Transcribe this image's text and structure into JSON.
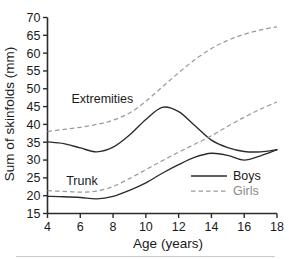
{
  "chart_data": {
    "type": "line",
    "title": "",
    "xlabel": "Age (years)",
    "ylabel": "Sum of skinfolds (mm)",
    "xlim": [
      4,
      18
    ],
    "ylim": [
      15,
      70
    ],
    "xticks": [
      4,
      6,
      8,
      10,
      12,
      14,
      16,
      18
    ],
    "yticks": [
      15,
      20,
      25,
      30,
      35,
      40,
      45,
      50,
      55,
      60,
      65,
      70
    ],
    "grid": false,
    "legend_position": "lower-right",
    "x": [
      4,
      5,
      6,
      7,
      8,
      9,
      10,
      11,
      12,
      13,
      14,
      15,
      16,
      17,
      18
    ],
    "series": [
      {
        "name": "Girls Extremities",
        "group": "Extremities",
        "sex": "Girls",
        "style": "dashed",
        "color": "#9a9a9a",
        "values": [
          38.0,
          38.6,
          39.2,
          40.0,
          41.2,
          43.2,
          46.5,
          50.5,
          54.5,
          58.2,
          61.3,
          63.6,
          65.3,
          66.5,
          67.4
        ]
      },
      {
        "name": "Boys Extremities",
        "group": "Extremities",
        "sex": "Boys",
        "style": "solid",
        "color": "#2b2b2b",
        "values": [
          35.1,
          34.6,
          33.4,
          32.3,
          33.6,
          37.0,
          41.4,
          44.8,
          43.6,
          39.6,
          35.6,
          33.5,
          32.4,
          32.3,
          32.9
        ]
      },
      {
        "name": "Girls Trunk",
        "group": "Trunk",
        "sex": "Girls",
        "style": "dashed",
        "color": "#9a9a9a",
        "values": [
          21.4,
          21.2,
          21.0,
          21.3,
          22.6,
          24.8,
          27.3,
          29.8,
          32.2,
          34.5,
          36.8,
          39.5,
          42.0,
          44.3,
          46.3
        ]
      },
      {
        "name": "Boys Trunk",
        "group": "Trunk",
        "sex": "Boys",
        "style": "solid",
        "color": "#2b2b2b",
        "values": [
          19.8,
          19.7,
          19.5,
          19.1,
          19.8,
          21.5,
          23.6,
          26.3,
          28.7,
          30.8,
          31.9,
          31.3,
          30.0,
          31.2,
          32.9
        ]
      }
    ],
    "annotations": [
      {
        "text": "Extremities",
        "x": 7.35,
        "y": 47.0
      },
      {
        "text": "Trunk",
        "x": 6.1,
        "y": 24.0
      }
    ],
    "legend": [
      {
        "label": "Boys",
        "style": "solid",
        "color": "#2b2b2b"
      },
      {
        "label": "Girls",
        "style": "dashed",
        "color": "#9a9a9a"
      }
    ]
  },
  "axes": {
    "y_title": "Sum of skinfolds (mm)",
    "x_title": "Age (years)",
    "y_tick_labels": [
      "70",
      "65",
      "60",
      "55",
      "50",
      "45",
      "40",
      "35",
      "30",
      "25",
      "20",
      "15"
    ],
    "x_tick_labels": [
      "4",
      "6",
      "8",
      "10",
      "12",
      "14",
      "16",
      "18"
    ]
  },
  "annotations": {
    "extremities_label": "Extremities",
    "trunk_label": "Trunk"
  },
  "legend": {
    "boys_label": "Boys",
    "girls_label": "Girls"
  }
}
